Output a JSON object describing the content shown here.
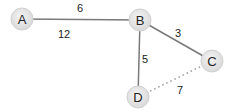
{
  "graph": {
    "nodes": [
      {
        "id": "A",
        "label": "A",
        "x": 22,
        "y": 19
      },
      {
        "id": "B",
        "label": "B",
        "x": 140,
        "y": 20
      },
      {
        "id": "C",
        "label": "C",
        "x": 212,
        "y": 61
      },
      {
        "id": "D",
        "label": "D",
        "x": 138,
        "y": 97
      }
    ],
    "edges": [
      {
        "from": "A",
        "to": "B",
        "style": "solid"
      },
      {
        "from": "B",
        "to": "C",
        "style": "solid"
      },
      {
        "from": "B",
        "to": "D",
        "style": "solid"
      },
      {
        "from": "D",
        "to": "C",
        "style": "dotted"
      }
    ],
    "labels": [
      {
        "text": "6",
        "x": 80,
        "y": 12
      },
      {
        "text": "12",
        "x": 64,
        "y": 38
      },
      {
        "text": "3",
        "x": 178,
        "y": 37
      },
      {
        "text": "5",
        "x": 145,
        "y": 63
      },
      {
        "text": "7",
        "x": 180,
        "y": 94
      }
    ],
    "colors": {
      "edge": "#7a7a7a",
      "dotted_edge": "#9a9a9a",
      "node_fill": "#e8e8e8",
      "node_stroke": "#d0d0d0"
    }
  }
}
